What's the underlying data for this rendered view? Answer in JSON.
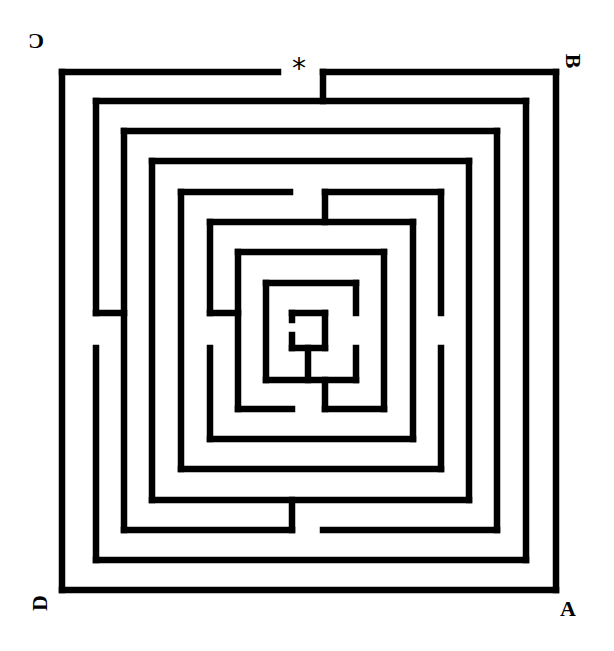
{
  "diagram": {
    "type": "maze",
    "style": "square concentric labyrinth",
    "wall_color": "#000000",
    "background_color": "#ffffff",
    "start_marker": {
      "symbol": "*",
      "position": "top-center entrance"
    },
    "corner_labels": {
      "top_left": {
        "text": "C",
        "orientation": "rotated 180°"
      },
      "top_right": {
        "text": "B",
        "orientation": "rotated 90°"
      },
      "bottom_left": {
        "text": "D",
        "orientation": "rotated 270°"
      },
      "bottom_right": {
        "text": "A",
        "orientation": "upright"
      }
    },
    "walls": [
      [
        62,
        72,
        278,
        72
      ],
      [
        323,
        72,
        556,
        72
      ],
      [
        556,
        72,
        556,
        590
      ],
      [
        556,
        590,
        62,
        590
      ],
      [
        62,
        590,
        62,
        72
      ],
      [
        323,
        72,
        323,
        101
      ],
      [
        96,
        101,
        526,
        101
      ],
      [
        526,
        101,
        526,
        560
      ],
      [
        526,
        560,
        96,
        560
      ],
      [
        96,
        560,
        96,
        348
      ],
      [
        96,
        313,
        96,
        101
      ],
      [
        96,
        313,
        124,
        313
      ],
      [
        124,
        131,
        497,
        131
      ],
      [
        497,
        131,
        497,
        530
      ],
      [
        497,
        530,
        323,
        530
      ],
      [
        292,
        530,
        124,
        530
      ],
      [
        124,
        530,
        124,
        131
      ],
      [
        292,
        500,
        292,
        530
      ],
      [
        152,
        161,
        469,
        161
      ],
      [
        469,
        161,
        469,
        500
      ],
      [
        469,
        500,
        152,
        500
      ],
      [
        152,
        500,
        152,
        161
      ],
      [
        181,
        192,
        290,
        192
      ],
      [
        325,
        192,
        441,
        192
      ],
      [
        441,
        192,
        441,
        313
      ],
      [
        441,
        348,
        441,
        469
      ],
      [
        441,
        469,
        181,
        469
      ],
      [
        181,
        469,
        181,
        192
      ],
      [
        325,
        192,
        325,
        222
      ],
      [
        210,
        222,
        413,
        222
      ],
      [
        413,
        222,
        413,
        439
      ],
      [
        413,
        439,
        210,
        439
      ],
      [
        210,
        439,
        210,
        348
      ],
      [
        210,
        313,
        210,
        222
      ],
      [
        210,
        313,
        238,
        313
      ],
      [
        238,
        252,
        384,
        252
      ],
      [
        384,
        252,
        384,
        409
      ],
      [
        384,
        409,
        325,
        409
      ],
      [
        292,
        409,
        238,
        409
      ],
      [
        238,
        409,
        238,
        252
      ],
      [
        325,
        380,
        325,
        409
      ],
      [
        266,
        283,
        356,
        283
      ],
      [
        356,
        283,
        356,
        313
      ],
      [
        356,
        348,
        356,
        380
      ],
      [
        356,
        380,
        266,
        380
      ],
      [
        266,
        380,
        266,
        283
      ],
      [
        292,
        313,
        325,
        313
      ],
      [
        325,
        313,
        325,
        348
      ],
      [
        325,
        348,
        292,
        348
      ],
      [
        292,
        348,
        292,
        335
      ],
      [
        292,
        313,
        292,
        320
      ],
      [
        308,
        348,
        308,
        380
      ]
    ]
  }
}
